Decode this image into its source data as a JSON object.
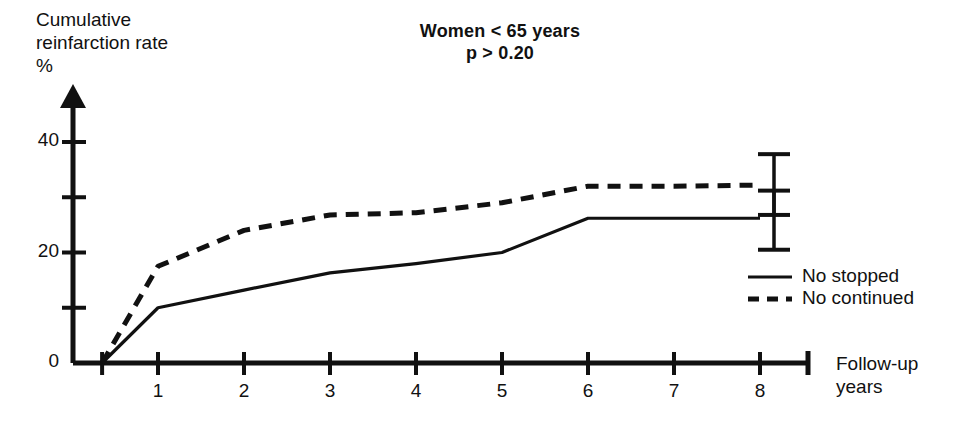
{
  "chart_data": {
    "type": "line",
    "title": "Women < 65 years",
    "subtitle": "p > 0.20",
    "xlabel": "Follow-up\nyears",
    "ylabel": "Cumulative\nreinfarction rate\n%",
    "xlim": [
      0,
      8.6
    ],
    "ylim": [
      0,
      46
    ],
    "grid": false,
    "legend_position": "right-inside",
    "x_ticks": [
      1,
      2,
      3,
      4,
      5,
      6,
      7,
      8
    ],
    "x_tick_labels": [
      "1",
      "2",
      "3",
      "4",
      "5",
      "6",
      "7",
      "8"
    ],
    "y_ticks": [
      0,
      10,
      20,
      30,
      40
    ],
    "y_tick_labels": [
      "0",
      "",
      "20",
      "",
      "40"
    ],
    "series": [
      {
        "name": "No stopped",
        "style": "solid",
        "x": [
          0.35,
          1,
          2,
          3,
          4,
          5,
          6,
          7,
          8
        ],
        "values": [
          0,
          10.0,
          13.2,
          16.3,
          18.0,
          20.0,
          26.2,
          26.2,
          26.2
        ],
        "error_bar": {
          "x": 8,
          "value": 26.2,
          "low": 20.5,
          "high": 31.2
        }
      },
      {
        "name": "No continued",
        "style": "dashed",
        "x": [
          0.35,
          1,
          2,
          3,
          4,
          5,
          6,
          7,
          8
        ],
        "values": [
          0,
          17.5,
          24.0,
          26.8,
          27.2,
          29.0,
          32.0,
          32.0,
          32.2
        ],
        "error_bar": {
          "x": 8,
          "value": 32.2,
          "low": 26.8,
          "high": 37.8
        }
      }
    ]
  },
  "legend": {
    "items": [
      {
        "label": "No stopped",
        "style": "solid"
      },
      {
        "label": "No continued",
        "style": "dashed"
      }
    ]
  },
  "colors": {
    "ink": "#111111",
    "background": "#ffffff"
  }
}
